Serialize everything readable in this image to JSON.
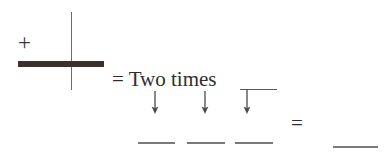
{
  "figure": {
    "type": "handwritten-math-worksheet",
    "background_color": "#ffffff",
    "ink_color": "#3a3a3a",
    "left_expression": {
      "plus_sign": "+",
      "fraction_bar_label": "thick horizontal bar",
      "vertical_rule_label": "vertical divider line"
    },
    "phrase": {
      "text": "= Two times",
      "equals_symbol": "=",
      "words": "Two times"
    },
    "arrows": [
      {
        "label": "↓",
        "name": "arrow-1"
      },
      {
        "label": "↓",
        "name": "arrow-2"
      },
      {
        "label": "↓",
        "name": "arrow-3"
      }
    ],
    "blank_rules": [
      {
        "name": "blank-1"
      },
      {
        "name": "blank-2"
      },
      {
        "name": "blank-3"
      },
      {
        "name": "blank-answer"
      }
    ],
    "right_equals": "=",
    "top_rule_label": "short rule above third arrow"
  }
}
